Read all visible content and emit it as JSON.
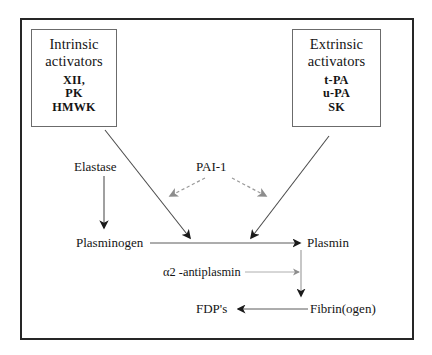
{
  "diagram": {
    "frame": {
      "stroke": "#262626"
    },
    "boxes": [
      {
        "id": "intrinsic",
        "title_line1": "Intrinsic",
        "title_line2": "activators",
        "items": [
          "XII,",
          "PK",
          "HMWK"
        ]
      },
      {
        "id": "extrinsic",
        "title_line1": "Extrinsic",
        "title_line2": "activators",
        "items": [
          "t-PA",
          "u-PA",
          "SK"
        ]
      }
    ],
    "nodes": {
      "elastase": "Elastase",
      "pai1": "PAI-1",
      "plasminogen": "Plasminogen",
      "plasmin": "Plasmin",
      "antiplasmin": "α2 -antiplasmin",
      "fdps": "FDP's",
      "fibrinogen": "Fibrin(ogen)"
    },
    "edges": [
      {
        "name": "intrinsic-to-plasmin",
        "from": "Intrinsic activators",
        "to": "Plasmin",
        "style": "solid",
        "color": "#3a3a3a"
      },
      {
        "name": "extrinsic-to-plasmin",
        "from": "Extrinsic activators",
        "to": "Plasmin",
        "style": "solid",
        "color": "#3a3a3a"
      },
      {
        "name": "elastase-to-plasminogen",
        "from": "Elastase",
        "to": "Plasminogen",
        "style": "solid",
        "color": "#3a3a3a"
      },
      {
        "name": "plasminogen-to-plasmin",
        "from": "Plasminogen",
        "to": "Plasmin",
        "style": "solid",
        "color": "#3a3a3a"
      },
      {
        "name": "pai1-inhibits-intrinsic-arm",
        "from": "PAI-1",
        "to": "intrinsic activation arm",
        "style": "dashed",
        "color": "#8a8a8a"
      },
      {
        "name": "pai1-inhibits-extrinsic-arm",
        "from": "PAI-1",
        "to": "extrinsic activation arm",
        "style": "dashed",
        "color": "#8a8a8a"
      },
      {
        "name": "antiplasmin-inhibits-plasmin",
        "from": "α2 -antiplasmin",
        "to": "Plasmin",
        "style": "solid-thin",
        "color": "#8a8a8a"
      },
      {
        "name": "plasmin-to-fibrinogen",
        "from": "Plasmin",
        "to": "Fibrin(ogen)",
        "style": "solid",
        "color": "#3a3a3a"
      },
      {
        "name": "fibrinogen-to-fdps",
        "from": "Fibrin(ogen)",
        "to": "FDP's",
        "style": "solid",
        "color": "#3a3a3a"
      }
    ]
  }
}
